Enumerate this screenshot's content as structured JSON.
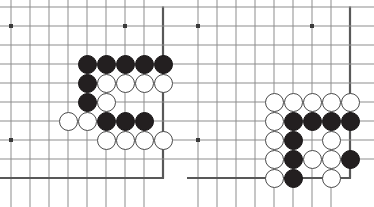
{
  "figure": {
    "type": "go-board-diagram-pair",
    "panel_count": 2,
    "width": 374,
    "height": 207
  },
  "style": {
    "grid_line_color": "#8d8d8d",
    "edge_line_color": "#585858",
    "star_point_color": "#3a3a3a",
    "black_stone_color": "#231f20",
    "white_stone_fill": "#ffffff",
    "white_stone_outline": "#4a4a4a",
    "background_color": "#ffffff"
  },
  "geometry": {
    "cell_size": 19,
    "stone_diameter": 19,
    "origin_x": 11,
    "origin_y": 7,
    "columns": 9,
    "rows": 10,
    "edge_line_width": 2.2,
    "grid_line_width": 1,
    "star_point_size": 4
  },
  "boards": [
    {
      "name": "left-board",
      "label": "Left corner position",
      "corner": "top-right-edge-and-bottom-edge",
      "star_points": [
        {
          "col": 0,
          "row": 1
        },
        {
          "col": 6,
          "row": 1
        },
        {
          "col": 0,
          "row": 7
        }
      ],
      "stones": [
        {
          "col": 4,
          "row": 3,
          "color": "black"
        },
        {
          "col": 5,
          "row": 3,
          "color": "black"
        },
        {
          "col": 6,
          "row": 3,
          "color": "black"
        },
        {
          "col": 7,
          "row": 3,
          "color": "black"
        },
        {
          "col": 8,
          "row": 3,
          "color": "black"
        },
        {
          "col": 4,
          "row": 4,
          "color": "black"
        },
        {
          "col": 5,
          "row": 4,
          "color": "white"
        },
        {
          "col": 6,
          "row": 4,
          "color": "white"
        },
        {
          "col": 7,
          "row": 4,
          "color": "white"
        },
        {
          "col": 8,
          "row": 4,
          "color": "white"
        },
        {
          "col": 4,
          "row": 5,
          "color": "black"
        },
        {
          "col": 5,
          "row": 5,
          "color": "white"
        },
        {
          "col": 3,
          "row": 6,
          "color": "white"
        },
        {
          "col": 4,
          "row": 6,
          "color": "white"
        },
        {
          "col": 5,
          "row": 6,
          "color": "black"
        },
        {
          "col": 6,
          "row": 6,
          "color": "black"
        },
        {
          "col": 7,
          "row": 6,
          "color": "black"
        },
        {
          "col": 5,
          "row": 7,
          "color": "white"
        },
        {
          "col": 6,
          "row": 7,
          "color": "white"
        },
        {
          "col": 7,
          "row": 7,
          "color": "white"
        },
        {
          "col": 8,
          "row": 7,
          "color": "white"
        }
      ]
    },
    {
      "name": "right-board",
      "label": "Right corner position",
      "corner": "top-right-edge-and-bottom-edge",
      "star_points": [
        {
          "col": 0,
          "row": 1
        },
        {
          "col": 6,
          "row": 1
        },
        {
          "col": 0,
          "row": 7
        }
      ],
      "stones": [
        {
          "col": 4,
          "row": 5,
          "color": "white"
        },
        {
          "col": 5,
          "row": 5,
          "color": "white"
        },
        {
          "col": 6,
          "row": 5,
          "color": "white"
        },
        {
          "col": 7,
          "row": 5,
          "color": "white"
        },
        {
          "col": 8,
          "row": 5,
          "color": "white"
        },
        {
          "col": 4,
          "row": 6,
          "color": "white"
        },
        {
          "col": 5,
          "row": 6,
          "color": "black"
        },
        {
          "col": 6,
          "row": 6,
          "color": "black"
        },
        {
          "col": 7,
          "row": 6,
          "color": "black"
        },
        {
          "col": 8,
          "row": 6,
          "color": "black"
        },
        {
          "col": 4,
          "row": 7,
          "color": "white"
        },
        {
          "col": 5,
          "row": 7,
          "color": "black"
        },
        {
          "col": 7,
          "row": 7,
          "color": "white"
        },
        {
          "col": 4,
          "row": 8,
          "color": "white"
        },
        {
          "col": 5,
          "row": 8,
          "color": "black"
        },
        {
          "col": 6,
          "row": 8,
          "color": "white"
        },
        {
          "col": 7,
          "row": 8,
          "color": "white"
        },
        {
          "col": 8,
          "row": 8,
          "color": "black"
        },
        {
          "col": 4,
          "row": 9,
          "color": "white"
        },
        {
          "col": 5,
          "row": 9,
          "color": "black"
        },
        {
          "col": 7,
          "row": 9,
          "color": "white"
        }
      ]
    }
  ]
}
